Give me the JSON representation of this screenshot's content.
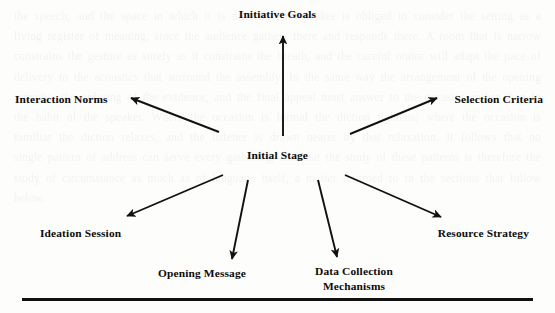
{
  "document": {
    "type": "radial-diagram",
    "background_note": "scanned page with faint bleed-through text",
    "ghost_text": "the speech, and the space in which it is uttered. The speaker is obliged to consider the setting as a living register of meaning, since the audience gathers there and responds there. A room that is narrow constrains the gesture as surely as it constrains the breath, and the careful orator will adapt the pace of delivery to the acoustics that surround the assembly. In the same way the arrangement of the opening remarks, the ordering of the evidence, and the final appeal must answer to the occasion rather than to the habit of the speaker. Where the occasion is formal the diction tightens; where the occasion is familiar the diction relaxes, and the listener is drawn nearer by that relaxation. It follows that no single pattern of address can serve every gathering, and that the study of these patterns is therefore the study of circumstance as much as of language itself, a matter returned to in the sections that follow below."
  },
  "diagram": {
    "center": {
      "id": "initial-stage",
      "label": "Initial Stage"
    },
    "spokes": [
      {
        "id": "initiative-goals",
        "label": "Initiative Goals",
        "direction": "up"
      },
      {
        "id": "interaction-norms",
        "label": "Interaction Norms",
        "direction": "up-left"
      },
      {
        "id": "selection-criteria",
        "label": "Selection Criteria",
        "direction": "up-right"
      },
      {
        "id": "ideation-session",
        "label": "Ideation Session",
        "direction": "down-left"
      },
      {
        "id": "resource-strategy",
        "label": "Resource Strategy",
        "direction": "down-right"
      },
      {
        "id": "opening-message",
        "label": "Opening Message",
        "direction": "down"
      },
      {
        "id": "data-collection",
        "label": "Data Collection Mechanisms",
        "label_line1": "Data Collection",
        "label_line2": "Mechanisms",
        "direction": "down"
      }
    ],
    "colors": {
      "arrow": "#111111",
      "text": "#0b0b0b",
      "page": "#fdfdfc",
      "rule": "#111111"
    }
  }
}
